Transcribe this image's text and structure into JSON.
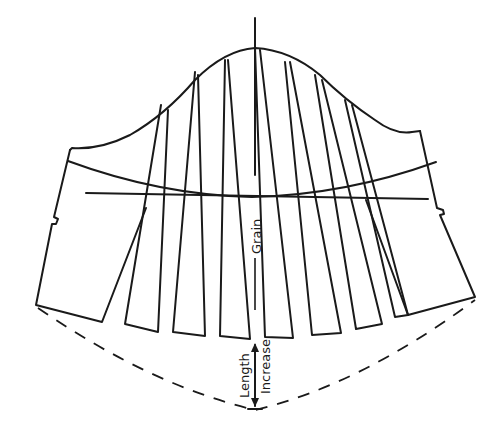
{
  "diagram": {
    "type": "sewing-pattern-slash-and-spread",
    "labels": {
      "grain": "Grain",
      "length": "Length",
      "increase": "Increase"
    },
    "strip_count": 7,
    "line_color": "#1a1a1a",
    "background_color": "#ffffff"
  }
}
